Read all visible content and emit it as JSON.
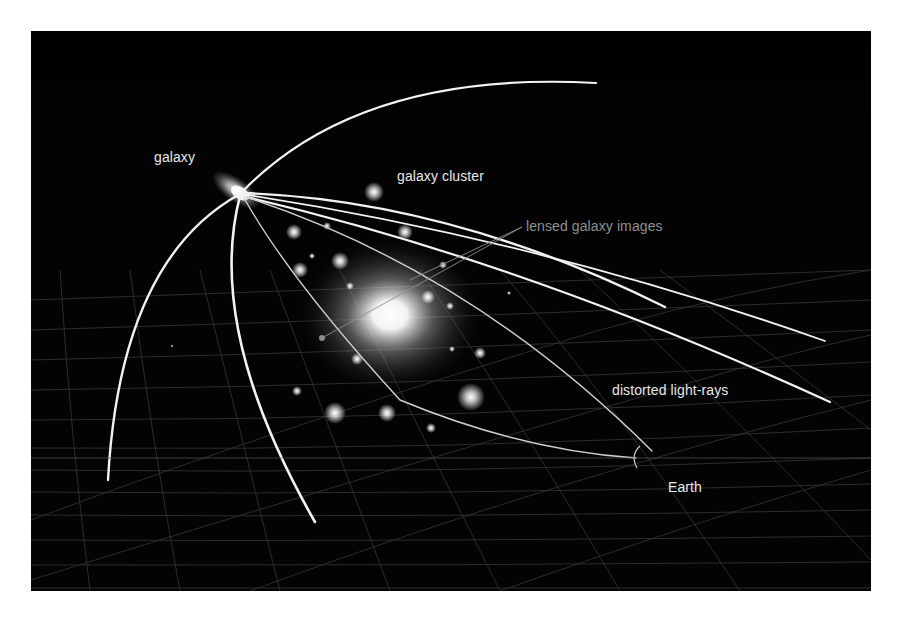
{
  "diagram": {
    "background": "#030303",
    "labels": {
      "galaxy": "galaxy",
      "galaxy_cluster": "galaxy cluster",
      "lensed_images": "lensed galaxy images",
      "light_rays": "distorted light-rays",
      "earth": "Earth"
    },
    "colors": {
      "ray": "#f2f2f2",
      "lensed_label": "#8f8f8f",
      "label": "#e8e8e8",
      "grid": "#3a3a3a"
    }
  }
}
